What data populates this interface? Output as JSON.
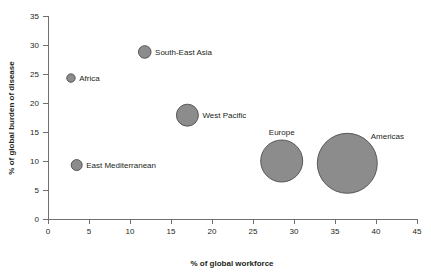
{
  "chart_data": {
    "type": "scatter",
    "title": "",
    "xlabel": "% of global workforce",
    "ylabel": "% of global burden of disease",
    "xlim": [
      0,
      45
    ],
    "ylim": [
      0,
      35
    ],
    "xticks": [
      "0",
      "5",
      "10",
      "15",
      "20",
      "25",
      "30",
      "35",
      "40",
      "45"
    ],
    "yticks": [
      "0",
      "5",
      "10",
      "15",
      "20",
      "25",
      "30",
      "35"
    ],
    "grid": false,
    "legend": "none",
    "bubble_color": "#8c8c8c",
    "bubble_edge_color": "#4d4d4d",
    "axis_color": "#6f6f6f",
    "text_color": "#231f20",
    "points": [
      {
        "label": "Africa",
        "x": 2.8,
        "y": 24.3,
        "size": 4.2,
        "label_position": "right"
      },
      {
        "label": "South-East Asia",
        "x": 11.8,
        "y": 28.8,
        "size": 6.3,
        "label_position": "right"
      },
      {
        "label": "East Mediterranean",
        "x": 3.5,
        "y": 9.3,
        "size": 5.5,
        "label_position": "right"
      },
      {
        "label": "West Pacific",
        "x": 17.0,
        "y": 17.9,
        "size": 11.0,
        "label_position": "right"
      },
      {
        "label": "Europe",
        "x": 28.5,
        "y": 10.0,
        "size": 21.0,
        "label_position": "above"
      },
      {
        "label": "Americas",
        "x": 36.5,
        "y": 9.6,
        "size": 30.0,
        "label_position": "upper-right"
      }
    ]
  }
}
